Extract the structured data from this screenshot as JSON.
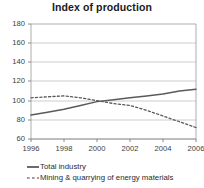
{
  "chart_data": {
    "type": "line",
    "title": "Index of production",
    "xlabel": "",
    "ylabel": "",
    "xlim": [
      1996,
      2006
    ],
    "ylim": [
      60,
      180
    ],
    "ytick_step": 20,
    "grid": true,
    "legend_position": "bottom-left",
    "yticks": [
      180,
      160,
      140,
      120,
      100,
      80,
      60
    ],
    "xticks": [
      1996,
      1998,
      2000,
      2002,
      2004,
      2006
    ],
    "x": [
      1996,
      1997,
      1998,
      1999,
      2000,
      2001,
      2002,
      2003,
      2004,
      2005,
      2006
    ],
    "series": [
      {
        "name": "Total industry",
        "style": "solid",
        "color": "#5a5a5a",
        "values": [
          85,
          88,
          91,
          95,
          99,
          101,
          103,
          105,
          107,
          110,
          112
        ]
      },
      {
        "name": "Mining & quarrying of energy materials",
        "style": "dashed",
        "color": "#5a5a5a",
        "values": [
          103,
          104,
          105,
          103,
          100,
          97,
          95,
          90,
          84,
          78,
          72
        ]
      }
    ]
  },
  "chart": {
    "title": "Index of production"
  },
  "axes": {
    "y_labels": [
      "180",
      "160",
      "140",
      "120",
      "100",
      "80",
      "60"
    ],
    "x_labels": [
      "1996",
      "1998",
      "2000",
      "2002",
      "2004",
      "2006"
    ]
  },
  "legend": {
    "items": [
      {
        "label": "Total industry",
        "marker": "solid-line-icon"
      },
      {
        "label": "Mining & quarrying of energy materials",
        "marker": "dashed-line-icon"
      }
    ]
  }
}
